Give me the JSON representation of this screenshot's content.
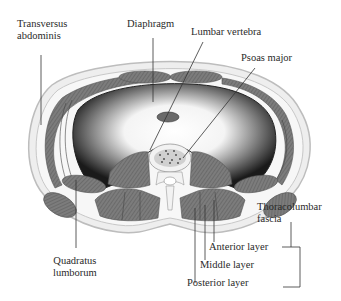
{
  "diagram": {
    "type": "anatomical cross-section",
    "labels": {
      "transversus_abdominis_line1": "Transversus",
      "transversus_abdominis_line2": "abdominis",
      "diaphragm": "Diaphragm",
      "lumbar_vertebra": "Lumbar vertebra",
      "psoas_major": "Psoas major",
      "thoracolumbar_fascia_line1": "Thoracolumbar",
      "thoracolumbar_fascia_line2": "fascia",
      "anterior_layer": "Anterior layer",
      "middle_layer": "Middle layer",
      "posterior_layer": "Posterior layer",
      "quadratus_lumborum_line1": "Quadratus",
      "quadratus_lumborum_line2": "lumborum"
    },
    "colors": {
      "text": "#2a2a2a",
      "leader_line": "#333333",
      "muscle": "#7a7a7a",
      "muscle_dark": "#555555",
      "cavity_dark": "#1e1e1e",
      "skin": "#e6e6e6",
      "bone": "#f2f2f2"
    }
  }
}
